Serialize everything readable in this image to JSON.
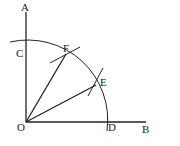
{
  "diagram": {
    "labels": {
      "A": "A",
      "B": "B",
      "C": "C",
      "D": "D",
      "E": "E",
      "F": "F",
      "O": "O"
    }
  }
}
